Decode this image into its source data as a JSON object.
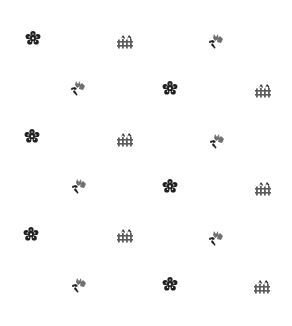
{
  "pattern": {
    "background": "#ffffff",
    "colors": {
      "dark": "#1a1a1a",
      "mid": "#5a5a5a",
      "light": "#8a8a8a"
    },
    "motif_types": [
      "flower-rosette",
      "fence-with-birds",
      "tulip-bouquet"
    ],
    "motifs": [
      {
        "type": "flower",
        "x": 33,
        "y": 38
      },
      {
        "type": "fence",
        "x": 125,
        "y": 41
      },
      {
        "type": "tulip",
        "x": 215,
        "y": 41
      },
      {
        "type": "tulip",
        "x": 77,
        "y": 88
      },
      {
        "type": "flower",
        "x": 170,
        "y": 88
      },
      {
        "type": "fence",
        "x": 263,
        "y": 90
      },
      {
        "type": "flower",
        "x": 32,
        "y": 136
      },
      {
        "type": "fence",
        "x": 125,
        "y": 139
      },
      {
        "type": "tulip",
        "x": 216,
        "y": 141
      },
      {
        "type": "tulip",
        "x": 78,
        "y": 186
      },
      {
        "type": "flower",
        "x": 170,
        "y": 186
      },
      {
        "type": "fence",
        "x": 263,
        "y": 188
      },
      {
        "type": "flower",
        "x": 31,
        "y": 234
      },
      {
        "type": "fence",
        "x": 125,
        "y": 235
      },
      {
        "type": "tulip",
        "x": 215,
        "y": 238
      },
      {
        "type": "tulip",
        "x": 78,
        "y": 285
      },
      {
        "type": "flower",
        "x": 170,
        "y": 284
      },
      {
        "type": "fence",
        "x": 262,
        "y": 286
      }
    ]
  }
}
